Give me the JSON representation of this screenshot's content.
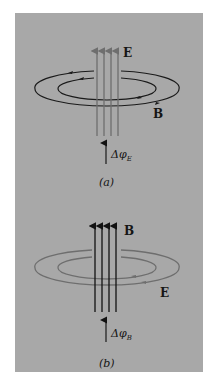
{
  "figure": {
    "background_color": "#a8a8a8",
    "panel_a": {
      "caption": "(a)",
      "field_lines_label": "E",
      "field_lines_color": "#6e6e6e",
      "loop_label": "B",
      "loop_color": "#1a1a1a",
      "flux_label_prefix": "Δφ",
      "flux_label_subscript": "E",
      "field_line_count": 4
    },
    "panel_b": {
      "caption": "(b)",
      "field_lines_label": "B",
      "field_lines_color": "#111111",
      "loop_label": "E",
      "loop_color": "#6e6e6e",
      "flux_label_prefix": "Δφ",
      "flux_label_subscript": "B",
      "field_line_count": 4
    }
  }
}
